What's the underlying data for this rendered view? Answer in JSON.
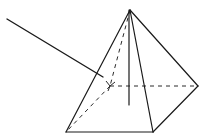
{
  "diagram": {
    "type": "square-pyramid-wireframe",
    "width": 214,
    "height": 140,
    "colors": {
      "background": "#ffffff",
      "line": "#1a1a1a"
    },
    "vertices": {
      "apex": [
        130,
        10
      ],
      "front_left": [
        66,
        132
      ],
      "front_right": [
        153,
        132
      ],
      "back_right": [
        198,
        86
      ],
      "back_left_hidden": [
        110,
        86
      ],
      "height_foot": [
        129,
        105
      ]
    },
    "visible_edges": [
      {
        "name": "apex-front-left",
        "from": "apex",
        "to": "front_left"
      },
      {
        "name": "apex-front-right",
        "from": "apex",
        "to": "front_right"
      },
      {
        "name": "apex-back-right",
        "from": "apex",
        "to": "back_right"
      },
      {
        "name": "base-front",
        "from": "front_left",
        "to": "front_right"
      },
      {
        "name": "base-right",
        "from": "front_right",
        "to": "back_right"
      },
      {
        "name": "height-line",
        "from": "apex",
        "to": "height_foot"
      }
    ],
    "hidden_edges": [
      {
        "name": "apex-back-left",
        "from": "apex",
        "to": "back_left_hidden"
      },
      {
        "name": "base-left",
        "from": "back_left_hidden",
        "to": "front_left"
      },
      {
        "name": "base-back",
        "from": "back_left_hidden",
        "to": "back_right"
      }
    ],
    "pointer_line": {
      "from": [
        7,
        19
      ],
      "to": [
        103,
        77
      ]
    },
    "corner_mark": {
      "at": [
        110,
        86
      ]
    }
  }
}
